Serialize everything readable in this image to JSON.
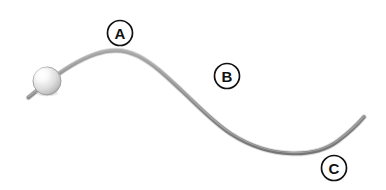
{
  "figure": {
    "background_color": "#ffffff",
    "width": 386,
    "height": 190
  },
  "track": {
    "name": "curved-wire-track",
    "color": "#8d8d8d",
    "highlight_color": "#b9b9b9",
    "shadow_color": "#6f6f6f",
    "stroke_width": 3.6,
    "path": "M 28.5 97.5 L 44 85 C 60 72 78 60 96 54 C 112 48.5 126 50 138 56 C 154 64 168 78 182 91 C 199 107 214 123 231 134 C 252 147.5 272 153 292 153.5 C 310 154 326 150 338 141 C 350 132 358 124 364 117",
    "start_point": {
      "x": 28.5,
      "y": 97.5
    },
    "crest_point": {
      "x": 124,
      "y": 52
    },
    "inflection_point": {
      "x": 210,
      "y": 118
    },
    "trough_point": {
      "x": 296,
      "y": 153
    },
    "end_point": {
      "x": 364,
      "y": 117
    }
  },
  "ball": {
    "name": "ball",
    "center_x": 47,
    "center_y": 81,
    "radius": 14,
    "fill_light": "#fdfdfd",
    "fill_mid": "#e2e2e2",
    "fill_dark": "#b0b0b0",
    "edge_color": "#9a9a9a",
    "highlight_x": 41,
    "highlight_y": 74
  },
  "labels": [
    {
      "id": "label-a",
      "text": "A",
      "name": "label-a",
      "cx": 120,
      "cy": 33,
      "r": 12.5,
      "circle_stroke": "#111111",
      "circle_fill": "#ffffff",
      "text_color": "#111111",
      "describes": "crest of the track"
    },
    {
      "id": "label-b",
      "text": "B",
      "name": "label-b",
      "cx": 227,
      "cy": 76,
      "r": 12.5,
      "circle_stroke": "#111111",
      "circle_fill": "#ffffff",
      "text_color": "#111111",
      "describes": "descending slope of the track"
    },
    {
      "id": "label-c",
      "text": "C",
      "name": "label-c",
      "cx": 334,
      "cy": 168,
      "r": 12.5,
      "circle_stroke": "#111111",
      "circle_fill": "#ffffff",
      "text_color": "#111111",
      "describes": "trough / rising end of the track"
    }
  ]
}
